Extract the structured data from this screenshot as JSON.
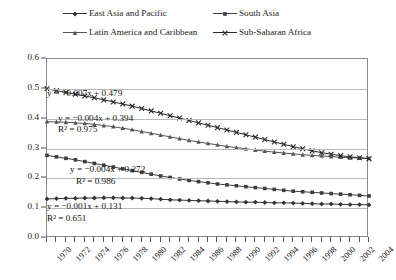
{
  "chart_data": {
    "type": "line",
    "title": "",
    "xlabel": "",
    "ylabel": "",
    "xlim": [
      1970,
      2004
    ],
    "ylim": [
      0.0,
      0.6
    ],
    "ytick_step": 0.1,
    "grid": true,
    "legend_position": "top-center",
    "yticks": [
      "0.0",
      "0.1",
      "0.2",
      "0.3",
      "0.4",
      "0.5",
      "0.6"
    ],
    "ytick_values": [
      0.0,
      0.1,
      0.2,
      0.3,
      0.4,
      0.5,
      0.6
    ],
    "x": [
      1970,
      1971,
      1972,
      1973,
      1974,
      1975,
      1976,
      1977,
      1978,
      1979,
      1980,
      1981,
      1982,
      1983,
      1984,
      1985,
      1986,
      1987,
      1988,
      1989,
      1990,
      1991,
      1992,
      1993,
      1994,
      1995,
      1996,
      1997,
      1998,
      1999,
      2000,
      2001,
      2002,
      2003,
      2004
    ],
    "xtick_labels": [
      "1970",
      "1972",
      "1974",
      "1976",
      "1978",
      "1980",
      "1982",
      "1984",
      "1986",
      "1988",
      "1990",
      "1992",
      "1994",
      "1996",
      "1998",
      "2000",
      "2002",
      "2004"
    ],
    "xtick_label_values": [
      1970,
      1972,
      1974,
      1976,
      1978,
      1980,
      1982,
      1984,
      1986,
      1988,
      1990,
      1992,
      1994,
      1996,
      1998,
      2000,
      2002,
      2004
    ],
    "series": [
      {
        "name": "East Asia and Pacific",
        "marker": "diamond",
        "color": "#333333",
        "values": [
          0.131,
          0.132,
          0.133,
          0.133,
          0.134,
          0.134,
          0.135,
          0.135,
          0.134,
          0.134,
          0.133,
          0.132,
          0.13,
          0.128,
          0.127,
          0.126,
          0.125,
          0.124,
          0.123,
          0.122,
          0.121,
          0.12,
          0.12,
          0.119,
          0.118,
          0.118,
          0.117,
          0.116,
          0.115,
          0.114,
          0.114,
          0.113,
          0.112,
          0.112,
          0.111
        ]
      },
      {
        "name": "South Asia",
        "marker": "square",
        "color": "#3d3d3d",
        "values": [
          0.277,
          0.272,
          0.267,
          0.262,
          0.256,
          0.25,
          0.244,
          0.238,
          0.232,
          0.226,
          0.22,
          0.214,
          0.208,
          0.203,
          0.198,
          0.193,
          0.189,
          0.185,
          0.181,
          0.178,
          0.175,
          0.172,
          0.169,
          0.166,
          0.163,
          0.16,
          0.157,
          0.155,
          0.153,
          0.151,
          0.149,
          0.147,
          0.145,
          0.143,
          0.141
        ]
      },
      {
        "name": "Latin America and Caribbean",
        "marker": "triangle",
        "color": "#555555",
        "values": [
          0.39,
          0.389,
          0.388,
          0.386,
          0.384,
          0.381,
          0.377,
          0.373,
          0.368,
          0.363,
          0.357,
          0.351,
          0.345,
          0.339,
          0.333,
          0.327,
          0.322,
          0.317,
          0.312,
          0.307,
          0.303,
          0.299,
          0.295,
          0.291,
          0.288,
          0.285,
          0.282,
          0.279,
          0.277,
          0.275,
          0.273,
          0.271,
          0.269,
          0.268,
          0.267
        ]
      },
      {
        "name": "Sub-Saharan Africa",
        "marker": "cross",
        "color": "#2b2b2b",
        "values": [
          0.5,
          0.494,
          0.488,
          0.482,
          0.476,
          0.47,
          0.463,
          0.456,
          0.449,
          0.442,
          0.434,
          0.426,
          0.418,
          0.41,
          0.402,
          0.394,
          0.386,
          0.378,
          0.37,
          0.362,
          0.354,
          0.346,
          0.338,
          0.33,
          0.322,
          0.314,
          0.306,
          0.299,
          0.292,
          0.286,
          0.281,
          0.276,
          0.272,
          0.269,
          0.266
        ]
      }
    ],
    "annotations": [
      {
        "equation": "y = −0.007x + 0.479",
        "r2": "",
        "r2_label": "",
        "series": "Sub-Saharan Africa"
      },
      {
        "equation": "y = −0.004x + 0.394",
        "r2": "0.975",
        "r2_label": "R² = 0.975",
        "series": "Latin America and Caribbean"
      },
      {
        "equation": "y = −0.004x + 0.272",
        "r2": "0.986",
        "r2_label": "R² = 0.986",
        "series": "South Asia"
      },
      {
        "equation": "y = −0.001x + 0.131",
        "r2": "0.651",
        "r2_label": "R² = 0.651",
        "series": "East Asia and Pacific"
      }
    ]
  },
  "legend": {
    "items": [
      {
        "label": "East Asia and Pacific",
        "marker": "diamond"
      },
      {
        "label": "South Asia",
        "marker": "square"
      },
      {
        "label": "Latin America and Caribbean",
        "marker": "triangle"
      },
      {
        "label": "Sub-Saharan Africa",
        "marker": "cross"
      }
    ]
  },
  "colors": {
    "axis": "#8a8a8a",
    "grid": "#b9b9b9",
    "text": "#1a1a1a",
    "background": "#ffffff"
  }
}
